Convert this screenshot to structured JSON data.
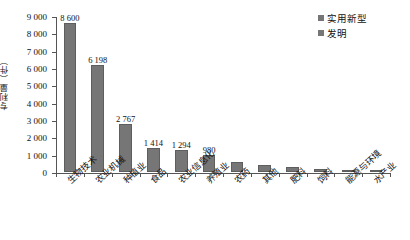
{
  "chart_data": {
    "type": "bar",
    "title": "",
    "subtitle": "",
    "xlabel": "",
    "ylabel": "专利量（件）",
    "ylim": [
      0,
      9000
    ],
    "ytick_values": [
      0,
      1000,
      2000,
      3000,
      4000,
      5000,
      6000,
      7000,
      8000,
      9000
    ],
    "ytick_labels": [
      "0",
      "1 000",
      "2 000",
      "3 000",
      "4 000",
      "5 000",
      "6 000",
      "7 000",
      "8 000",
      "9 000"
    ],
    "grid": false,
    "legend_position": "top-right",
    "bar_color": "#767676",
    "axis_color": "#555555",
    "categories": [
      "生物技术",
      "农业机械",
      "种植业",
      "食品",
      "农业信息化",
      "养殖业",
      "农药",
      "其他",
      "肥料",
      "饲料",
      "能源与环境",
      "水产业"
    ],
    "values": [
      8600,
      6198,
      2767,
      1414,
      1294,
      980,
      560,
      380,
      300,
      150,
      110,
      50
    ],
    "data_labels": [
      "8 600",
      "6 198",
      "2 767",
      "1 414",
      "1 294",
      "980",
      "",
      "",
      "",
      "",
      "",
      ""
    ],
    "series": [
      {
        "name": "实用新型",
        "values": [
          8600,
          6198,
          2767,
          1414,
          1294,
          980,
          560,
          380,
          300,
          150,
          110,
          50
        ]
      }
    ],
    "legend": [
      {
        "label": "实用新型",
        "color": "#767676"
      },
      {
        "label": "发明",
        "color": "#767676"
      }
    ]
  }
}
